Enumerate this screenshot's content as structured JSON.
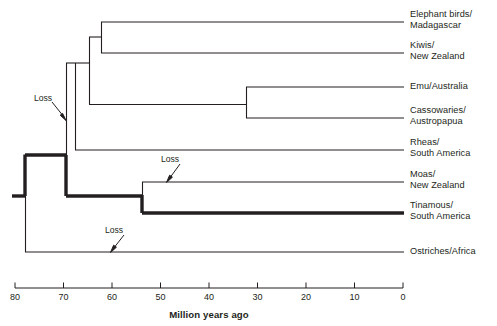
{
  "figure": {
    "type": "phylogenetic-tree-cladogram",
    "axis": {
      "title": "Million years ago",
      "ticks": [
        80,
        70,
        60,
        50,
        40,
        30,
        20,
        10,
        0
      ],
      "tick_labels": [
        "80",
        "70",
        "60",
        "50",
        "40",
        "30",
        "20",
        "10",
        "0"
      ],
      "range_mya": [
        80,
        0
      ],
      "direction": "right-to-left-decreasing",
      "px_at_80": 15,
      "px_at_0": 403
    },
    "taxa": [
      {
        "id": "elephant-birds",
        "line1": "Elephant birds/",
        "line2": "Madagascar",
        "y": 22,
        "weight": "thin"
      },
      {
        "id": "kiwis",
        "line1": "Kiwis/",
        "line2": "New Zealand",
        "y": 53,
        "weight": "thin"
      },
      {
        "id": "emu",
        "line1": "Emu/Australia",
        "line2": "",
        "y": 87,
        "weight": "thin"
      },
      {
        "id": "cassowaries",
        "line1": "Cassowaries/",
        "line2": "Austropapua",
        "y": 118,
        "weight": "thin"
      },
      {
        "id": "rheas",
        "line1": "Rheas/",
        "line2": "South America",
        "y": 150,
        "weight": "thin"
      },
      {
        "id": "moas",
        "line1": "Moas/",
        "line2": "New Zealand",
        "y": 182,
        "weight": "thin"
      },
      {
        "id": "tinamous",
        "line1": "Tinamous/",
        "line2": "South America",
        "y": 213,
        "weight": "thick"
      },
      {
        "id": "ostriches",
        "line1": "Ostriches/Africa",
        "line2": "",
        "y": 252,
        "weight": "thin"
      }
    ],
    "nodes": [
      {
        "id": "root",
        "mya": 78.0,
        "x": 25,
        "children_y": [
          155,
          252
        ]
      },
      {
        "id": "palaeognath-crown",
        "mya": 69.5,
        "x": 66,
        "children_y": [
          63,
          196
        ]
      },
      {
        "id": "rheas-split",
        "mya": 68.5,
        "x": 75,
        "children_y": [
          84,
          150
        ]
      },
      {
        "id": "emu-cass-vs-kiwi",
        "mya": 66.5,
        "x": 89,
        "children_y": [
          37,
          105
        ]
      },
      {
        "id": "elephant-kiwi",
        "mya": 63.0,
        "x": 101,
        "children_y": [
          22,
          53
        ]
      },
      {
        "id": "emu-cassowary",
        "mya": 32.5,
        "x": 246,
        "children_y": [
          87,
          118
        ]
      },
      {
        "id": "moa-tinamou",
        "mya": 54.0,
        "x": 142,
        "children_y": [
          182,
          213
        ]
      }
    ],
    "annotations": [
      {
        "id": "loss-1",
        "label": "Loss",
        "label_x": 34,
        "label_y": 97,
        "arrow_from": [
          56,
          105
        ],
        "arrow_to": [
          66,
          119
        ]
      },
      {
        "id": "loss-2",
        "label": "Loss",
        "label_x": 160,
        "label_y": 157,
        "arrow_from": [
          180,
          166
        ],
        "arrow_to": [
          168,
          180
        ]
      },
      {
        "id": "loss-3",
        "label": "Loss",
        "label_x": 104,
        "label_y": 228,
        "arrow_from": [
          124,
          237
        ],
        "arrow_to": [
          112,
          250
        ]
      }
    ],
    "colors": {
      "line": "#231f20",
      "text": "#231f20",
      "background": "#ffffff"
    },
    "line_widths": {
      "thin": 1.1,
      "thick": 3.4,
      "axis": 1.0
    }
  }
}
